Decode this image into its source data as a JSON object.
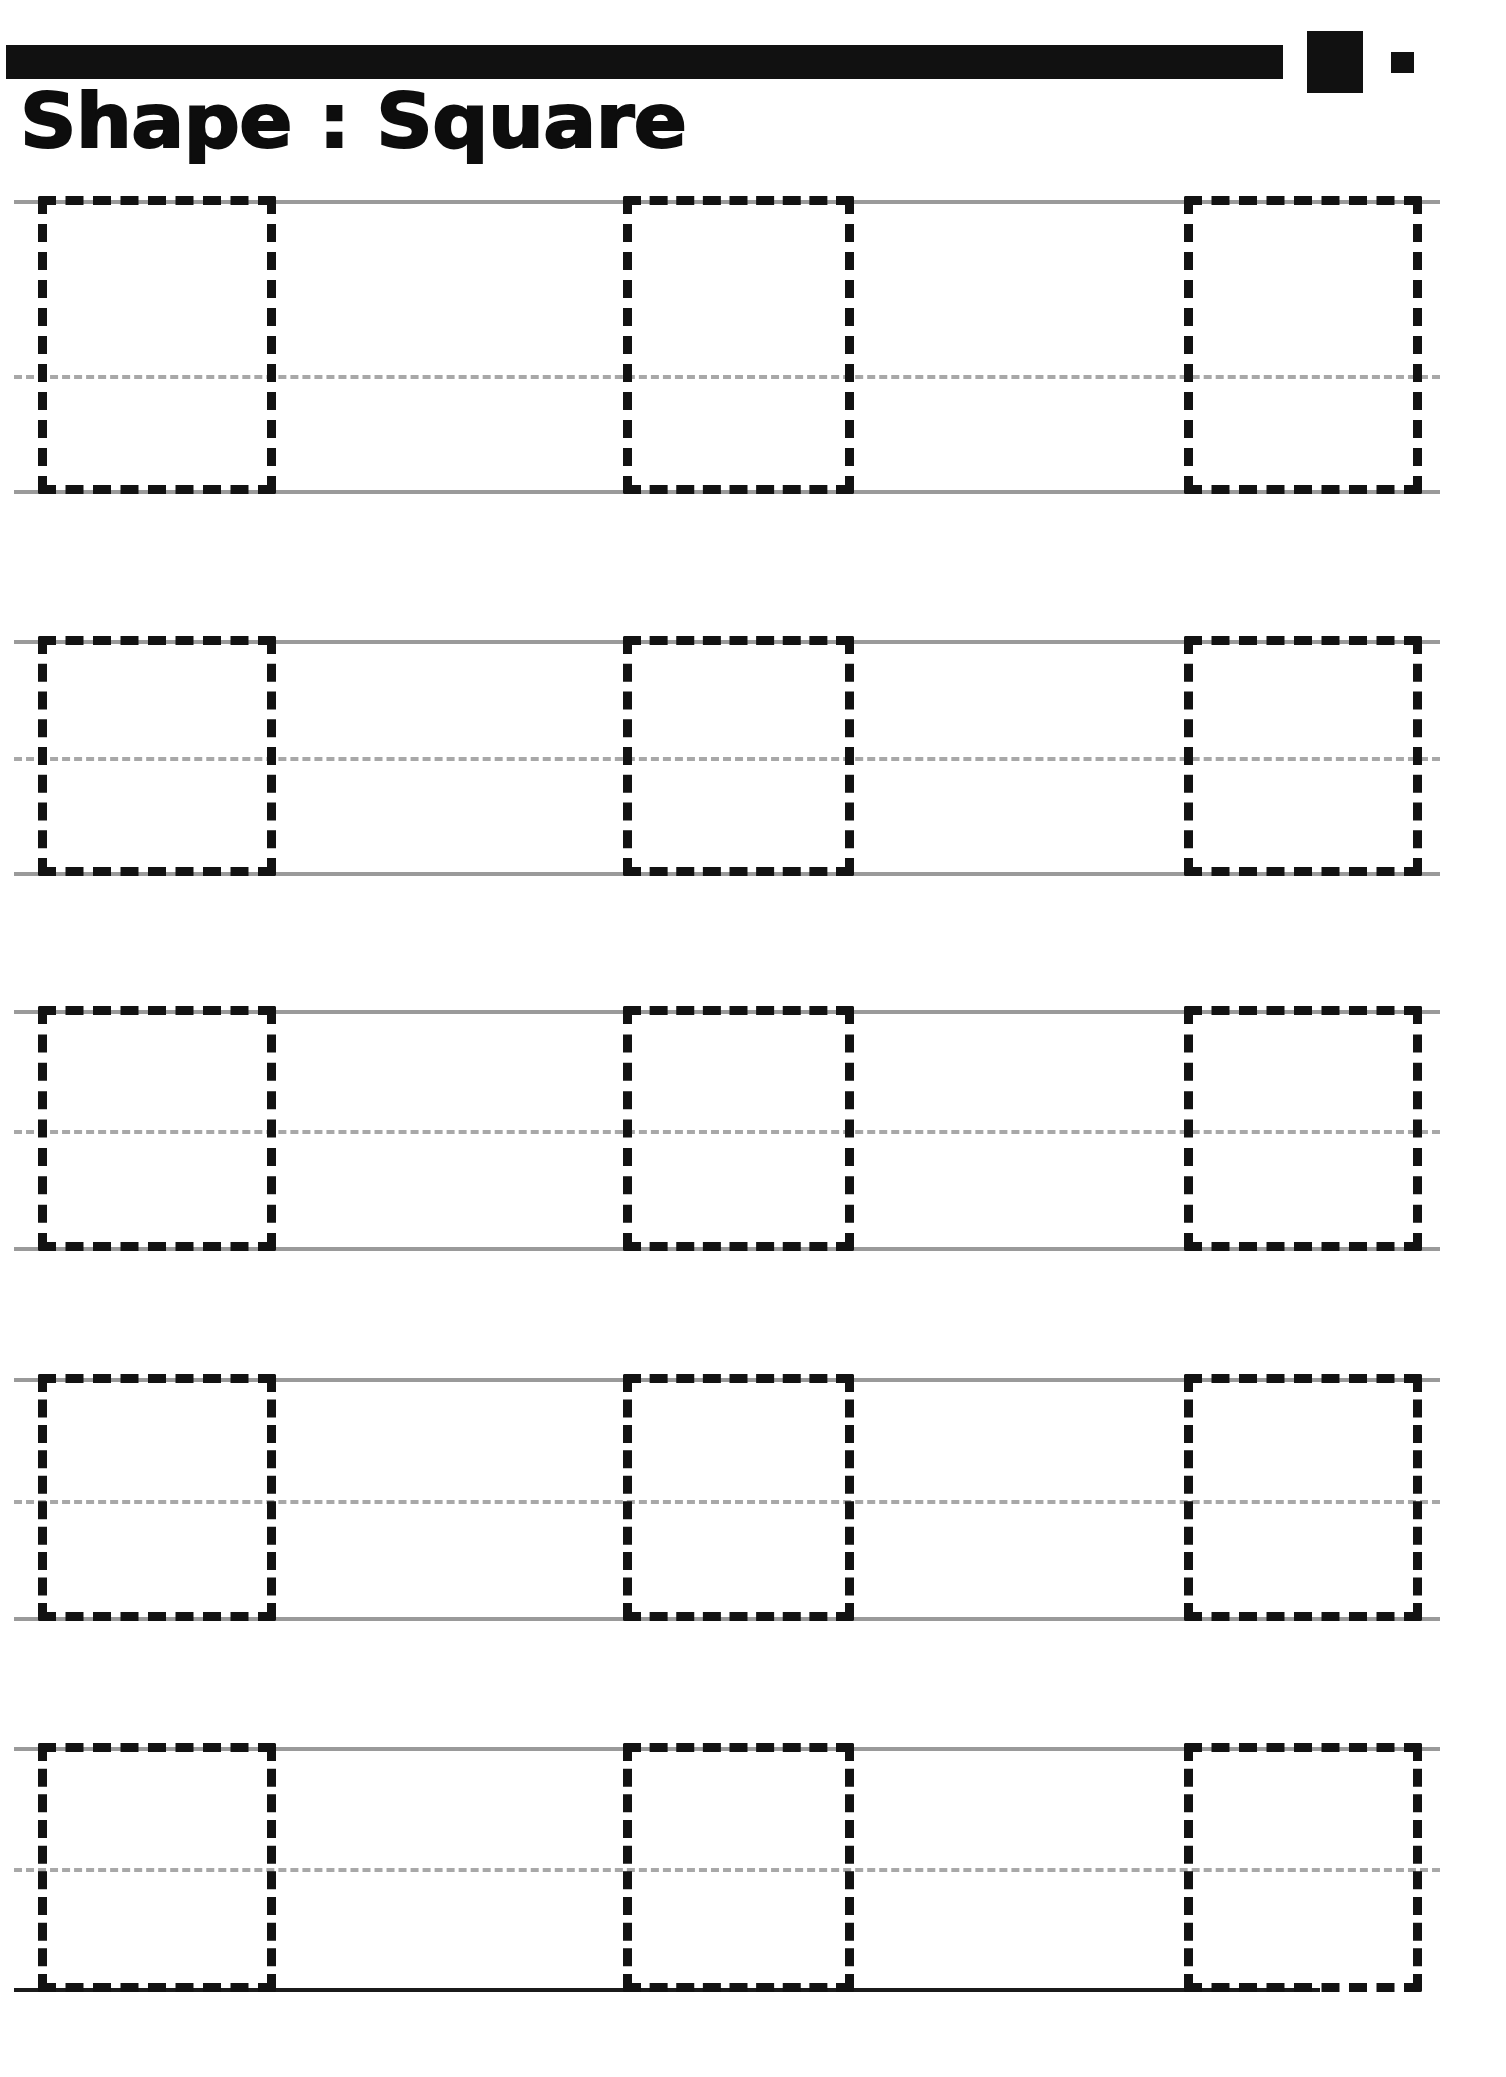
{
  "worksheet": {
    "title": "Shape : Square",
    "shape_name": "Square",
    "label_prefix": "Shape",
    "separator": ":",
    "page_width": 1506,
    "page_height": 2077,
    "background_color": "#ffffff"
  },
  "header": {
    "bar": {
      "x": 6,
      "y": 45,
      "width": 1277,
      "height": 34,
      "color": "#111111"
    },
    "square_large": {
      "x": 1307,
      "y": 31,
      "width": 56,
      "height": 62,
      "color": "#111111"
    },
    "square_small": {
      "x": 1391,
      "y": 52,
      "width": 23,
      "height": 21,
      "color": "#111111"
    }
  },
  "style": {
    "rule_color": "#9a9a9a",
    "rule_dashed_color": "#a8a8a8",
    "rule_dark_color": "#1b1b1b",
    "trace_color": "#121212",
    "rule_thickness": 4,
    "trace_thickness": 9
  },
  "rows": [
    {
      "index": 1,
      "top_y": 200,
      "mid_y": 375,
      "bottom_y": 490,
      "line_left": 14,
      "line_right": 1440,
      "bottom_dark": false,
      "squares": [
        {
          "x": 38,
          "y": 196,
          "width": 238,
          "height": 298
        },
        {
          "x": 623,
          "y": 196,
          "width": 231,
          "height": 298
        },
        {
          "x": 1184,
          "y": 196,
          "width": 238,
          "height": 298
        }
      ]
    },
    {
      "index": 2,
      "top_y": 640,
      "mid_y": 757,
      "bottom_y": 872,
      "line_left": 14,
      "line_right": 1440,
      "bottom_dark": false,
      "squares": [
        {
          "x": 38,
          "y": 636,
          "width": 238,
          "height": 240
        },
        {
          "x": 623,
          "y": 636,
          "width": 231,
          "height": 240
        },
        {
          "x": 1184,
          "y": 636,
          "width": 238,
          "height": 240
        }
      ]
    },
    {
      "index": 3,
      "top_y": 1010,
      "mid_y": 1130,
      "bottom_y": 1247,
      "line_left": 14,
      "line_right": 1440,
      "bottom_dark": false,
      "squares": [
        {
          "x": 38,
          "y": 1006,
          "width": 238,
          "height": 245
        },
        {
          "x": 623,
          "y": 1006,
          "width": 231,
          "height": 245
        },
        {
          "x": 1184,
          "y": 1006,
          "width": 238,
          "height": 245
        }
      ]
    },
    {
      "index": 4,
      "top_y": 1378,
      "mid_y": 1500,
      "bottom_y": 1617,
      "line_left": 14,
      "line_right": 1440,
      "bottom_dark": false,
      "squares": [
        {
          "x": 38,
          "y": 1374,
          "width": 238,
          "height": 247
        },
        {
          "x": 623,
          "y": 1374,
          "width": 231,
          "height": 247
        },
        {
          "x": 1184,
          "y": 1374,
          "width": 238,
          "height": 247
        }
      ]
    },
    {
      "index": 5,
      "top_y": 1747,
      "mid_y": 1868,
      "bottom_y": 1988,
      "line_left": 14,
      "line_right": 1440,
      "bottom_dark": true,
      "bottom_dark_right": 1320,
      "squares": [
        {
          "x": 38,
          "y": 1743,
          "width": 238,
          "height": 249
        },
        {
          "x": 623,
          "y": 1743,
          "width": 231,
          "height": 249
        },
        {
          "x": 1184,
          "y": 1743,
          "width": 238,
          "height": 249
        }
      ]
    }
  ]
}
